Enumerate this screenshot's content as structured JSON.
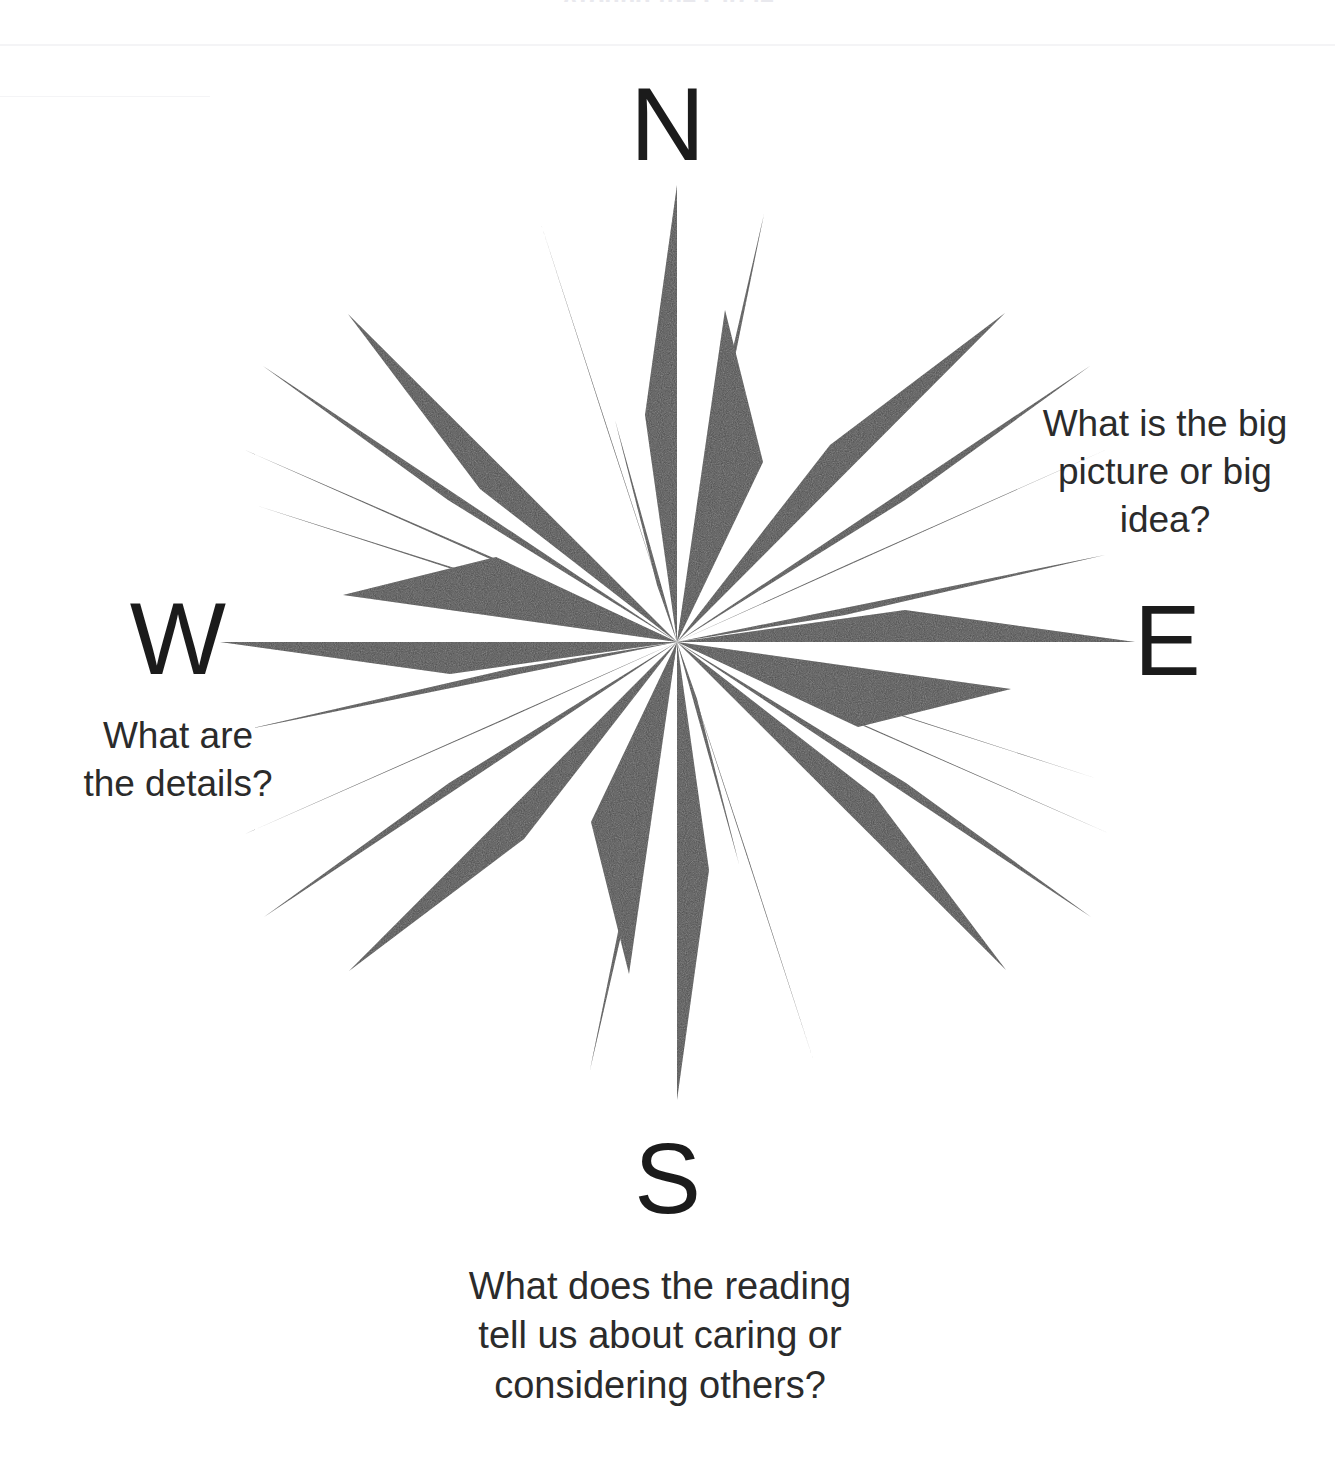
{
  "page": {
    "clipped_top_title": "Around the Circle",
    "background_color": "#ffffff",
    "ray_color": "#4d4d4d",
    "text_color": "#2b2b2b",
    "letter_color": "#1b1b1b"
  },
  "compass": {
    "name": "compass-rose",
    "center_x": 675,
    "center_y": 642,
    "cardinals": {
      "north": "N",
      "east": "E",
      "south": "S",
      "west": "W"
    }
  },
  "prompts": {
    "east": {
      "lines": [
        "What is the big",
        "picture or big",
        "idea?"
      ],
      "full": "What is the big picture or big idea?"
    },
    "west": {
      "lines": [
        "What are",
        "the details?"
      ],
      "full": "What are the details?"
    },
    "south": {
      "lines": [
        "What does the reading",
        "tell us about caring or",
        "considering others?"
      ],
      "full": "What does the reading tell us about caring or considering others?"
    }
  }
}
